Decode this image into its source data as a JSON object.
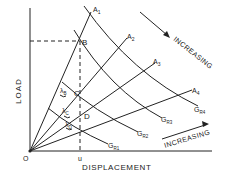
{
  "axes": {
    "y_label": "LOAD",
    "x_label": "DISPLACEMENT",
    "origin_label": "O",
    "x_marker_label": "u"
  },
  "points": {
    "B": "B",
    "C": "C",
    "D": "D"
  },
  "rays": [
    {
      "label": "A",
      "sub": "1"
    },
    {
      "label": "A",
      "sub": "2"
    },
    {
      "label": "A",
      "sub": "3"
    },
    {
      "label": "A",
      "sub": "4"
    }
  ],
  "curves": [
    {
      "label": "G",
      "sub": "R1"
    },
    {
      "label": "G",
      "sub": "R2"
    },
    {
      "label": "G",
      "sub": "R3"
    },
    {
      "label": "G",
      "sub": "R4"
    }
  ],
  "angles": [
    {
      "label": "λ",
      "sub": "B"
    },
    {
      "label": "λ",
      "sub": "C"
    },
    {
      "label": "λ",
      "sub": "D"
    }
  ],
  "annotations": {
    "increasing_top": "INCREASING",
    "increasing_bottom": "INCREASING"
  },
  "colors": {
    "line": "#222222",
    "background": "#ffffff"
  }
}
